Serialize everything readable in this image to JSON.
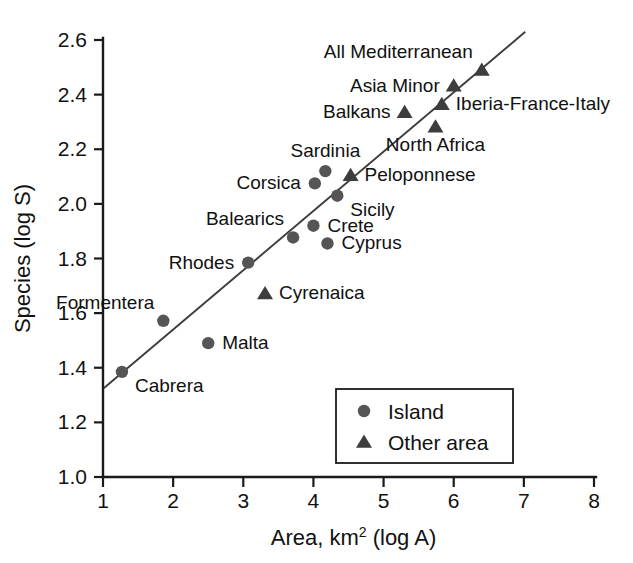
{
  "chart_data": {
    "type": "scatter",
    "title": "",
    "xlabel": "Area, km2 (log A)",
    "xlabel_base": "Area, km",
    "xlabel_sup": "2",
    "xlabel_tail": " (log A)",
    "ylabel": "Species (log S)",
    "xlim": [
      1,
      8
    ],
    "ylim": [
      1.0,
      2.6
    ],
    "xticks": [
      "1",
      "2",
      "3",
      "4",
      "5",
      "6",
      "7",
      "8"
    ],
    "xtick_values": [
      1,
      2,
      3,
      4,
      5,
      6,
      7,
      8
    ],
    "yticks": [
      "1.0",
      "1.2",
      "1.4",
      "1.6",
      "1.8",
      "2.0",
      "2.2",
      "2.4",
      "2.6"
    ],
    "ytick_values": [
      1.0,
      1.2,
      1.4,
      1.6,
      1.8,
      2.0,
      2.2,
      2.4,
      2.6
    ],
    "grid": false,
    "legend_position": "inside-lower-right",
    "marker_color": "#555555",
    "triangle_color": "#3d3d3d",
    "line_color": "#3c3c3c",
    "trend_line": {
      "x_start": 1.01,
      "y_start": 1.325,
      "x_end": 7.02,
      "y_end": 2.63,
      "slope": 0.217,
      "intercept": 1.106
    },
    "legend": [
      {
        "key": "island",
        "label": "Island",
        "marker": "circle"
      },
      {
        "key": "other",
        "label": "Other area",
        "marker": "triangle"
      }
    ],
    "series": [
      {
        "name": "Island",
        "marker": "circle",
        "points": [
          {
            "label": "Cabrera",
            "x": 1.27,
            "y": 1.385,
            "label_pos": "below-right"
          },
          {
            "label": "Formentera",
            "x": 1.86,
            "y": 1.572,
            "label_pos": "above-left"
          },
          {
            "label": "Malta",
            "x": 2.5,
            "y": 1.49,
            "label_pos": "right"
          },
          {
            "label": "Rhodes",
            "x": 3.07,
            "y": 1.785,
            "label_pos": "left"
          },
          {
            "label": "Balearics",
            "x": 3.71,
            "y": 1.877,
            "label_pos": "above-left"
          },
          {
            "label": "Crete",
            "x": 4.0,
            "y": 1.92,
            "label_pos": "right"
          },
          {
            "label": "Cyprus",
            "x": 4.2,
            "y": 1.855,
            "label_pos": "right"
          },
          {
            "label": "Corsica",
            "x": 4.02,
            "y": 2.075,
            "label_pos": "left"
          },
          {
            "label": "Sardinia",
            "x": 4.17,
            "y": 2.12,
            "label_pos": "above"
          },
          {
            "label": "Sicily",
            "x": 4.34,
            "y": 2.03,
            "label_pos": "below-right"
          }
        ]
      },
      {
        "name": "Other area",
        "marker": "triangle",
        "points": [
          {
            "label": "Cyrenaica",
            "x": 3.31,
            "y": 1.672,
            "label_pos": "right"
          },
          {
            "label": "Peloponnese",
            "x": 4.53,
            "y": 2.105,
            "label_pos": "right"
          },
          {
            "label": "Balkans",
            "x": 5.3,
            "y": 2.335,
            "label_pos": "left"
          },
          {
            "label": "North Africa",
            "x": 5.74,
            "y": 2.282,
            "label_pos": "below"
          },
          {
            "label": "Iberia-France-Italy",
            "x": 5.83,
            "y": 2.365,
            "label_pos": "right"
          },
          {
            "label": "Asia Minor",
            "x": 6.0,
            "y": 2.432,
            "label_pos": "left"
          },
          {
            "label": "All Mediterranean",
            "x": 6.4,
            "y": 2.49,
            "label_pos": "above-left"
          }
        ]
      }
    ]
  }
}
